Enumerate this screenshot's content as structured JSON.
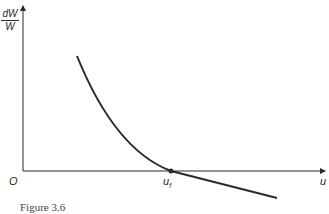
{
  "figure": {
    "caption": "Figure 3.6",
    "y_label": {
      "numerator": "dW",
      "denominator": "W"
    },
    "x_label": "u",
    "origin_label": "O",
    "point_label": {
      "base": "u",
      "sub": "f"
    },
    "colors": {
      "axis": "#2a2a2a",
      "curve": "#2a2a2a",
      "background": "#ffffff"
    }
  }
}
